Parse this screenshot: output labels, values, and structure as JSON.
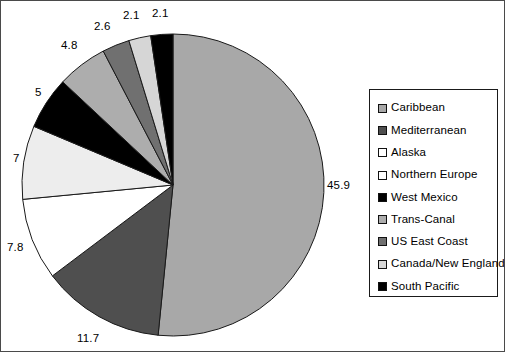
{
  "chart_data": {
    "type": "pie",
    "title": "",
    "legend_position": "right",
    "start_angle_deg": 0,
    "direction": "clockwise",
    "total": 89.0,
    "labels": [
      "Caribbean",
      "Mediterranean",
      "Alaska",
      "Northern Europe",
      "West Mexico",
      "Trans-Canal",
      "US East Coast",
      "Canada/New England",
      "South Pacific"
    ],
    "values": [
      45.9,
      11.7,
      7.8,
      7,
      5,
      4.8,
      2.6,
      2.1,
      2.1
    ],
    "value_labels": [
      "45.9",
      "11.7",
      "7.8",
      "7",
      "5",
      "4.8",
      "2.6",
      "2.1",
      "2.1"
    ],
    "colors": [
      "#a8a8a8",
      "#4f4f4f",
      "#ffffff",
      "#ededed",
      "#000000",
      "#adadad",
      "#707070",
      "#d6d6d6",
      "#000000"
    ],
    "slice_border_color": "#1a1a1a",
    "grid": false
  },
  "pie": {
    "center_x": 172,
    "center_y": 184,
    "radius": 151,
    "slice_labels": [
      {
        "text": "45.9",
        "x": 326,
        "y": 179
      },
      {
        "text": "11.7",
        "x": 76,
        "y": 332
      },
      {
        "text": "7.8",
        "x": 6,
        "y": 241
      },
      {
        "text": "7",
        "x": 12,
        "y": 152
      },
      {
        "text": "5",
        "x": 34,
        "y": 86
      },
      {
        "text": "4.8",
        "x": 60,
        "y": 39
      },
      {
        "text": "2.6",
        "x": 93,
        "y": 20
      },
      {
        "text": "2.1",
        "x": 122,
        "y": 9
      },
      {
        "text": "2.1",
        "x": 151,
        "y": 7
      }
    ]
  },
  "legend": {
    "items": [
      {
        "label": "Caribbean",
        "color": "#a8a8a8",
        "swatch": "legend-swatch-caribbean"
      },
      {
        "label": "Mediterranean",
        "color": "#4f4f4f",
        "swatch": "legend-swatch-mediterranean"
      },
      {
        "label": "Alaska",
        "color": "#ffffff",
        "swatch": "legend-swatch-alaska"
      },
      {
        "label": "Northern Europe",
        "color": "#ffffff",
        "swatch": "legend-swatch-northern-europe"
      },
      {
        "label": "West Mexico",
        "color": "#000000",
        "swatch": "legend-swatch-west-mexico"
      },
      {
        "label": "Trans-Canal",
        "color": "#adadad",
        "swatch": "legend-swatch-trans-canal"
      },
      {
        "label": "US East Coast",
        "color": "#707070",
        "swatch": "legend-swatch-us-east-coast"
      },
      {
        "label": "Canada/New England",
        "color": "#d6d6d6",
        "swatch": "legend-swatch-canada-new-england"
      },
      {
        "label": "South Pacific",
        "color": "#000000",
        "swatch": "legend-swatch-south-pacific"
      }
    ]
  }
}
